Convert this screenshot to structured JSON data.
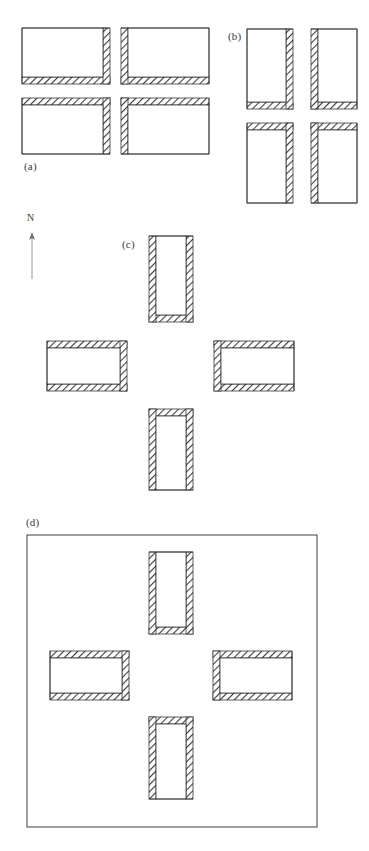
{
  "figure": {
    "title_visible": false,
    "background_color": "#ffffff",
    "line_color": "#2b2b2b",
    "hatch_color": "#3d3d3d",
    "compass": {
      "letter": "N",
      "orientation": "up",
      "x": 27,
      "y": 212,
      "shaft_length": 40,
      "color": "#8a8a8a"
    },
    "panels": [
      {
        "id": "a",
        "label": "(a)",
        "label_x": 24,
        "label_y": 160,
        "arrangement": "two-by-two-grid",
        "units": [
          {
            "name": "unit-a1",
            "x": 22,
            "y": 28,
            "w": 88,
            "h": 56,
            "orientation": "horizontal",
            "walled_sides": [
              "right",
              "bottom"
            ],
            "open_sides": [
              "top",
              "left"
            ]
          },
          {
            "name": "unit-a2",
            "x": 121,
            "y": 28,
            "w": 88,
            "h": 56,
            "orientation": "horizontal",
            "walled_sides": [
              "left",
              "bottom"
            ],
            "open_sides": [
              "top",
              "right"
            ]
          },
          {
            "name": "unit-a3",
            "x": 22,
            "y": 98,
            "w": 88,
            "h": 56,
            "orientation": "horizontal",
            "walled_sides": [
              "top",
              "right"
            ],
            "open_sides": [
              "bottom",
              "left"
            ]
          },
          {
            "name": "unit-a4",
            "x": 121,
            "y": 98,
            "w": 88,
            "h": 56,
            "orientation": "horizontal",
            "walled_sides": [
              "top",
              "left"
            ],
            "open_sides": [
              "bottom",
              "right"
            ]
          }
        ]
      },
      {
        "id": "b",
        "label": "(b)",
        "label_x": 228,
        "label_y": 30,
        "arrangement": "two-by-two-offset-grid",
        "units": [
          {
            "name": "unit-b1",
            "x": 247,
            "y": 29,
            "w": 46,
            "h": 80,
            "orientation": "vertical",
            "walled_sides": [
              "right",
              "bottom"
            ],
            "open_sides": [
              "top",
              "left"
            ]
          },
          {
            "name": "unit-b2",
            "x": 311,
            "y": 29,
            "w": 46,
            "h": 80,
            "orientation": "vertical",
            "walled_sides": [
              "left",
              "bottom"
            ],
            "open_sides": [
              "top",
              "right"
            ]
          },
          {
            "name": "unit-b3",
            "x": 247,
            "y": 123,
            "w": 46,
            "h": 80,
            "orientation": "vertical",
            "walled_sides": [
              "top",
              "right"
            ],
            "open_sides": [
              "bottom",
              "left"
            ]
          },
          {
            "name": "unit-b4",
            "x": 311,
            "y": 123,
            "w": 46,
            "h": 80,
            "orientation": "vertical",
            "walled_sides": [
              "top",
              "left"
            ],
            "open_sides": [
              "bottom",
              "right"
            ]
          }
        ]
      },
      {
        "id": "c",
        "label": "(c)",
        "label_x": 122,
        "label_y": 238,
        "arrangement": "cruciform",
        "units": [
          {
            "name": "unit-c-north",
            "x": 149,
            "y": 236,
            "w": 44,
            "h": 86,
            "orientation": "vertical",
            "walled_sides": [
              "left",
              "right",
              "bottom"
            ],
            "open_sides": [
              "top"
            ]
          },
          {
            "name": "unit-c-west",
            "x": 47,
            "y": 341,
            "w": 80,
            "h": 50,
            "orientation": "horizontal",
            "walled_sides": [
              "top",
              "right",
              "bottom"
            ],
            "open_sides": [
              "left"
            ]
          },
          {
            "name": "unit-c-east",
            "x": 214,
            "y": 341,
            "w": 80,
            "h": 50,
            "orientation": "horizontal",
            "walled_sides": [
              "top",
              "left",
              "bottom"
            ],
            "open_sides": [
              "right"
            ]
          },
          {
            "name": "unit-c-south",
            "x": 149,
            "y": 409,
            "w": 44,
            "h": 81,
            "orientation": "vertical",
            "walled_sides": [
              "top",
              "left",
              "right"
            ],
            "open_sides": [
              "bottom"
            ]
          }
        ]
      },
      {
        "id": "d",
        "label": "(d)",
        "label_x": 26,
        "label_y": 516,
        "arrangement": "cruciform-within-enclosure",
        "enclosure": {
          "name": "enclosure-wall",
          "x": 27,
          "y": 535,
          "w": 290,
          "h": 292
        },
        "units": [
          {
            "name": "unit-d-north",
            "x": 149,
            "y": 552,
            "w": 44,
            "h": 82,
            "orientation": "vertical",
            "walled_sides": [
              "left",
              "right",
              "bottom"
            ],
            "open_sides": [
              "top"
            ]
          },
          {
            "name": "unit-d-west",
            "x": 50,
            "y": 651,
            "w": 79,
            "h": 49,
            "orientation": "horizontal",
            "walled_sides": [
              "top",
              "right",
              "bottom"
            ],
            "open_sides": [
              "left"
            ]
          },
          {
            "name": "unit-d-east",
            "x": 213,
            "y": 651,
            "w": 79,
            "h": 49,
            "orientation": "horizontal",
            "walled_sides": [
              "top",
              "left",
              "bottom"
            ],
            "open_sides": [
              "right"
            ]
          },
          {
            "name": "unit-d-south",
            "x": 149,
            "y": 717,
            "w": 44,
            "h": 82,
            "orientation": "vertical",
            "walled_sides": [
              "top",
              "left",
              "right"
            ],
            "open_sides": [
              "bottom"
            ]
          }
        ]
      }
    ],
    "wall_thickness": 7
  }
}
